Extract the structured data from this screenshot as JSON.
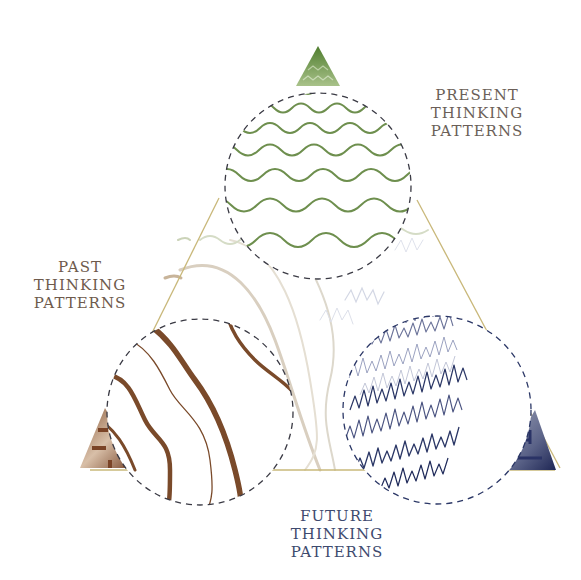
{
  "labels": {
    "present": {
      "line1": "PRESENT",
      "line2": "THINKING",
      "line3": "PATTERNS"
    },
    "past": {
      "line1": "PAST",
      "line2": "THINKING",
      "line3": "PATTERNS"
    },
    "future": {
      "line1": "FUTURE",
      "line2": "THINKING",
      "line3": "PATTERNS"
    }
  },
  "colors": {
    "present": "#6e8f4e",
    "past": "#7a4a2a",
    "future": "#2b3766",
    "triangle_outline": "#c9b87a",
    "dashed_circle": "#3a3a44"
  },
  "nodes": [
    {
      "id": "present",
      "pattern": "gentle-sine-waves",
      "position": "top"
    },
    {
      "id": "past",
      "pattern": "thick-diagonal-curves",
      "position": "bottom-left"
    },
    {
      "id": "future",
      "pattern": "jagged-zigzag-scribbles",
      "position": "bottom-right"
    }
  ]
}
